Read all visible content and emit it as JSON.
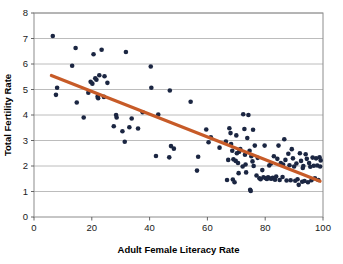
{
  "chart_data": {
    "type": "scatter",
    "title": "",
    "xlabel": "Adult Female Literacy Rate",
    "ylabel": "Total Fertility Rate",
    "xlim": [
      0,
      100
    ],
    "ylim": [
      0,
      8
    ],
    "xticks": [
      0,
      20,
      40,
      60,
      80,
      100
    ],
    "yticks": [
      0,
      1,
      2,
      3,
      4,
      5,
      6,
      7,
      8
    ],
    "xtick_labels": [
      "0",
      "20",
      "40",
      "60",
      "80",
      "100"
    ],
    "ytick_labels": [
      "0",
      "1",
      "2",
      "3",
      "4",
      "5",
      "6",
      "7",
      "8"
    ],
    "grid": "horizontal",
    "legend": "none",
    "marker_color": "#1b2642",
    "trendline_color": "#c75b28",
    "gridline_color": "#b4b4b4",
    "plot_border_color": "#8c8c8c",
    "background_color": "#ffffff",
    "trendline": {
      "label": "linear fit",
      "x_start": 6,
      "y_start": 5.55,
      "x_end": 99,
      "y_end": 1.4
    },
    "points": [
      [
        6.5,
        7.1
      ],
      [
        8.0,
        5.07
      ],
      [
        7.6,
        4.79
      ],
      [
        13.2,
        5.93
      ],
      [
        14.4,
        6.63
      ],
      [
        14.8,
        4.49
      ],
      [
        17.2,
        3.9
      ],
      [
        18.8,
        4.87
      ],
      [
        19.6,
        5.3
      ],
      [
        20.2,
        5.23
      ],
      [
        20.6,
        6.38
      ],
      [
        21.2,
        5.44
      ],
      [
        21.6,
        5.38
      ],
      [
        22.0,
        4.72
      ],
      [
        22.2,
        4.66
      ],
      [
        22.6,
        5.56
      ],
      [
        23.4,
        6.56
      ],
      [
        24.4,
        5.52
      ],
      [
        25.4,
        5.26
      ],
      [
        24.2,
        4.71
      ],
      [
        27.6,
        3.56
      ],
      [
        28.4,
        4.0
      ],
      [
        28.6,
        3.9
      ],
      [
        30.6,
        3.36
      ],
      [
        31.4,
        2.95
      ],
      [
        31.8,
        6.47
      ],
      [
        33.0,
        3.52
      ],
      [
        33.8,
        3.86
      ],
      [
        36.0,
        3.47
      ],
      [
        37.6,
        4.11
      ],
      [
        40.4,
        5.9
      ],
      [
        40.6,
        5.07
      ],
      [
        42.2,
        2.39
      ],
      [
        43.0,
        4.02
      ],
      [
        46.8,
        2.34
      ],
      [
        47.0,
        4.96
      ],
      [
        47.4,
        2.78
      ],
      [
        48.4,
        2.68
      ],
      [
        54.2,
        4.52
      ],
      [
        56.4,
        1.82
      ],
      [
        56.8,
        2.36
      ],
      [
        59.6,
        3.43
      ],
      [
        60.4,
        2.93
      ],
      [
        61.2,
        3.13
      ],
      [
        64.2,
        2.72
      ],
      [
        66.4,
        2.96
      ],
      [
        66.8,
        1.45
      ],
      [
        67.6,
        3.48
      ],
      [
        68.0,
        3.29
      ],
      [
        68.2,
        2.86
      ],
      [
        68.6,
        2.6
      ],
      [
        68.8,
        1.47
      ],
      [
        69.0,
        2.26
      ],
      [
        69.4,
        1.36
      ],
      [
        69.8,
        2.2
      ],
      [
        70.0,
        3.2
      ],
      [
        70.2,
        2.5
      ],
      [
        70.6,
        2.12
      ],
      [
        71.0,
        2.56
      ],
      [
        71.4,
        2.66
      ],
      [
        72.2,
        1.98
      ],
      [
        72.4,
        4.03
      ],
      [
        72.8,
        3.45
      ],
      [
        73.0,
        2.44
      ],
      [
        73.2,
        2.06
      ],
      [
        73.4,
        1.75
      ],
      [
        73.8,
        3.1
      ],
      [
        74.2,
        4.0
      ],
      [
        74.6,
        2.6
      ],
      [
        74.8,
        1.07
      ],
      [
        75.0,
        1.02
      ],
      [
        75.2,
        2.38
      ],
      [
        75.6,
        2.18
      ],
      [
        76.0,
        2.0
      ],
      [
        76.4,
        2.8
      ],
      [
        77.0,
        1.63
      ],
      [
        77.4,
        2.32
      ],
      [
        78.0,
        1.52
      ],
      [
        78.4,
        1.48
      ],
      [
        79.0,
        1.84
      ],
      [
        79.4,
        1.56
      ],
      [
        79.8,
        2.8
      ],
      [
        80.2,
        1.52
      ],
      [
        80.6,
        1.49
      ],
      [
        81.0,
        1.56
      ],
      [
        81.4,
        2.02
      ],
      [
        81.8,
        1.51
      ],
      [
        82.2,
        1.5
      ],
      [
        82.6,
        1.54
      ],
      [
        83.0,
        2.38
      ],
      [
        83.4,
        1.46
      ],
      [
        83.8,
        1.59
      ],
      [
        84.2,
        2.28
      ],
      [
        84.6,
        2.8
      ],
      [
        85.0,
        1.45
      ],
      [
        85.4,
        2.12
      ],
      [
        86.0,
        1.57
      ],
      [
        86.6,
        3.05
      ],
      [
        87.0,
        2.24
      ],
      [
        87.4,
        1.43
      ],
      [
        88.0,
        2.48
      ],
      [
        88.4,
        2.03
      ],
      [
        88.8,
        1.44
      ],
      [
        89.2,
        2.66
      ],
      [
        89.6,
        2.3
      ],
      [
        90.0,
        1.98
      ],
      [
        90.4,
        1.42
      ],
      [
        90.8,
        2.1
      ],
      [
        91.2,
        1.48
      ],
      [
        91.6,
        1.26
      ],
      [
        92.0,
        2.5
      ],
      [
        92.4,
        2.2
      ],
      [
        92.8,
        1.38
      ],
      [
        93.2,
        2.0
      ],
      [
        93.6,
        1.41
      ],
      [
        94.0,
        2.46
      ],
      [
        94.4,
        2.28
      ],
      [
        94.8,
        1.36
      ],
      [
        95.2,
        2.12
      ],
      [
        95.6,
        1.97
      ],
      [
        96.0,
        1.44
      ],
      [
        96.4,
        2.33
      ],
      [
        96.8,
        2.01
      ],
      [
        97.2,
        1.52
      ],
      [
        97.6,
        2.3
      ],
      [
        98.0,
        2.02
      ],
      [
        98.4,
        1.45
      ],
      [
        98.8,
        2.34
      ],
      [
        99.0,
        1.98
      ],
      [
        75.8,
        3.42
      ],
      [
        70.8,
        1.72
      ],
      [
        67.2,
        2.24
      ],
      [
        82.0,
        2.1
      ],
      [
        86.2,
        2.06
      ],
      [
        93.0,
        1.92
      ],
      [
        99.2,
        2.22
      ]
    ]
  }
}
